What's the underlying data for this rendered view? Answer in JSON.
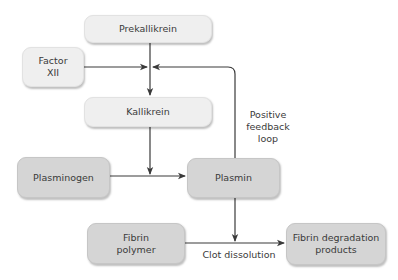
{
  "diagram": {
    "nodes": {
      "prekallikrein": "Prekallikrein",
      "factor_xii_line1": "Factor",
      "factor_xii_line2": "XII",
      "kallikrein": "Kallikrein",
      "plasminogen": "Plasminogen",
      "plasmin": "Plasmin",
      "fibrin_polymer_line1": "Fibrin",
      "fibrin_polymer_line2": "polymer",
      "fdp_line1": "Fibrin degradation",
      "fdp_line2": "products"
    },
    "labels": {
      "feedback_line1": "Positive",
      "feedback_line2": "feedback",
      "feedback_line3": "loop",
      "clot_dissolution": "Clot dissolution"
    },
    "edges": [
      {
        "from": "Prekallikrein",
        "to": "Kallikrein"
      },
      {
        "from": "Factor XII",
        "to": "Prekallikrein-Kallikrein junction"
      },
      {
        "from": "Kallikrein",
        "to": "Plasminogen-Plasmin junction"
      },
      {
        "from": "Plasminogen",
        "to": "Plasmin"
      },
      {
        "from": "Plasmin",
        "to": "Prekallikrein-Kallikrein junction",
        "label": "Positive feedback loop"
      },
      {
        "from": "Plasmin",
        "to": "Fibrin polymer-FDP junction"
      },
      {
        "from": "Fibrin polymer",
        "to": "Fibrin degradation products",
        "label": "Clot dissolution"
      }
    ],
    "colors": {
      "light_node": "#efefef",
      "dark_node": "#d5d5d5",
      "line": "#3a3a3a",
      "text": "#3a3a3a"
    }
  }
}
